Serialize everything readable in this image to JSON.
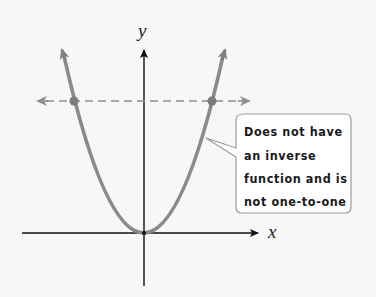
{
  "diagram": {
    "axes": {
      "x_label": "x",
      "y_label": "y"
    },
    "curve": {
      "type": "parabola",
      "equation_shape": "y = x^2",
      "color": "#8a8a8a"
    },
    "horizontal_line": {
      "style": "dashed",
      "color": "#8f8f8f"
    },
    "intersection_points": 2,
    "callout": {
      "lines": [
        "Does not have",
        "an inverse",
        "function and is",
        "not one-to-one"
      ]
    }
  }
}
